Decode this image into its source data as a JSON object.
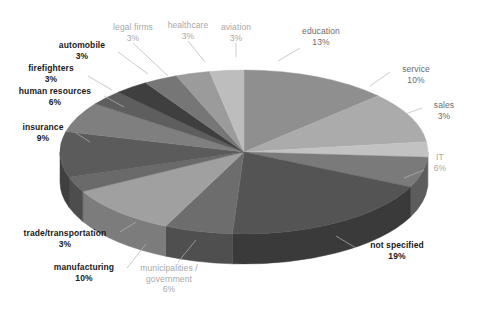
{
  "chart_data": {
    "type": "pie",
    "title": "",
    "subtitle": "",
    "xlabel": "",
    "ylabel": "",
    "legend_position": "none",
    "grid": false,
    "style": "3d-pie-grayscale",
    "total_percent": 100,
    "categories": [
      "education",
      "service",
      "sales",
      "IT",
      "not specified",
      "municipalities / government",
      "manufacturing",
      "trade/transportation",
      "insurance",
      "human resources",
      "firefighters",
      "automobile",
      "legal firms",
      "healthcare",
      "aviation"
    ],
    "values": [
      13,
      10,
      3,
      6,
      19,
      6,
      10,
      3,
      9,
      6,
      3,
      3,
      3,
      3,
      3
    ],
    "slices": [
      {
        "label": "education",
        "percent": 13,
        "percent_text": "13%",
        "color": "#8f8f8f",
        "side_color": "#6e6e6e"
      },
      {
        "label": "service",
        "percent": 10,
        "percent_text": "10%",
        "color": "#ababab",
        "side_color": "#868686"
      },
      {
        "label": "sales",
        "percent": 3,
        "percent_text": "3%",
        "color": "#c2c2c2",
        "side_color": "#9a9a9a"
      },
      {
        "label": "IT",
        "percent": 6,
        "percent_text": "6%",
        "color": "#7a7a7a",
        "side_color": "#5c5c5c"
      },
      {
        "label": "not specified",
        "percent": 19,
        "percent_text": "19%",
        "color": "#545454",
        "side_color": "#3a3a3a"
      },
      {
        "label": "municipalities / government",
        "percent": 6,
        "percent_text": "6%",
        "color": "#6d6d6d",
        "side_color": "#4f4f4f"
      },
      {
        "label": "manufacturing",
        "percent": 10,
        "percent_text": "10%",
        "color": "#a0a0a0",
        "side_color": "#7c7c7c"
      },
      {
        "label": "trade/transportation",
        "percent": 3,
        "percent_text": "3%",
        "color": "#6a6a6a",
        "side_color": "#4d4d4d"
      },
      {
        "label": "insurance",
        "percent": 9,
        "percent_text": "9%",
        "color": "#5b5b5b",
        "side_color": "#404040"
      },
      {
        "label": "human resources",
        "percent": 6,
        "percent_text": "6%",
        "color": "#7f7f7f",
        "side_color": "#5f5f5f"
      },
      {
        "label": "firefighters",
        "percent": 3,
        "percent_text": "3%",
        "color": "#5e5e5e",
        "side_color": "#434343"
      },
      {
        "label": "automobile",
        "percent": 3,
        "percent_text": "3%",
        "color": "#3f3f3f",
        "side_color": "#2e2e2e"
      },
      {
        "label": "legal firms",
        "percent": 3,
        "percent_text": "3%",
        "color": "#767676",
        "side_color": "#585858"
      },
      {
        "label": "healthcare",
        "percent": 3,
        "percent_text": "3%",
        "color": "#9b9b9b",
        "side_color": "#767676"
      },
      {
        "label": "aviation",
        "percent": 3,
        "percent_text": "3%",
        "color": "#bdbdbd",
        "side_color": "#949494"
      }
    ]
  },
  "labels": {
    "legal_firms": {
      "name": "legal firms",
      "percent": "3%"
    },
    "healthcare": {
      "name": "healthcare",
      "percent": "3%"
    },
    "aviation": {
      "name": "aviation",
      "percent": "3%"
    },
    "education": {
      "name": "education",
      "percent": "13%"
    },
    "service": {
      "name": "service",
      "percent": "10%"
    },
    "sales": {
      "name": "sales",
      "percent": "3%"
    },
    "it": {
      "name": "IT",
      "percent": "6%"
    },
    "not_specified": {
      "name": "not specified",
      "percent": "19%"
    },
    "municipalities": {
      "name": "municipalities /",
      "name2": "government",
      "percent": "6%"
    },
    "manufacturing": {
      "name": "manufacturing",
      "percent": "10%"
    },
    "trade": {
      "name": "trade/transportation",
      "percent": "3%"
    },
    "insurance": {
      "name": "insurance",
      "percent": "9%"
    },
    "human_resources": {
      "name": "human resources",
      "percent": "6%"
    },
    "firefighters": {
      "name": "firefighters",
      "percent": "3%"
    },
    "automobile": {
      "name": "automobile",
      "percent": "3%"
    }
  }
}
